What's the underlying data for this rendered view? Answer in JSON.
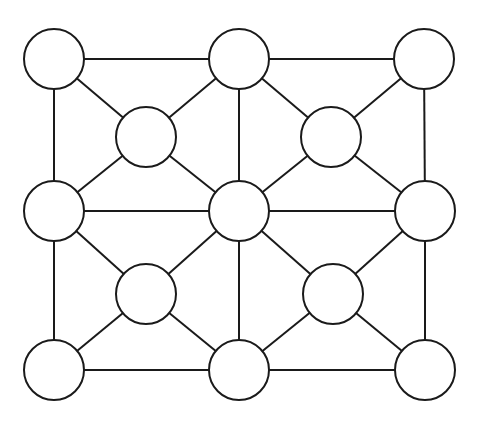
{
  "diagram": {
    "type": "graph",
    "node_radius": 30,
    "stroke_color": "#1a1a1a",
    "fill_color": "#ffffff",
    "nodes": [
      {
        "id": "n1",
        "x": 54,
        "y": 59
      },
      {
        "id": "n2",
        "x": 239,
        "y": 59
      },
      {
        "id": "n3",
        "x": 424,
        "y": 59
      },
      {
        "id": "n4",
        "x": 146,
        "y": 137
      },
      {
        "id": "n5",
        "x": 331,
        "y": 137
      },
      {
        "id": "n6",
        "x": 54,
        "y": 211
      },
      {
        "id": "n7",
        "x": 239,
        "y": 211
      },
      {
        "id": "n8",
        "x": 425,
        "y": 211
      },
      {
        "id": "n9",
        "x": 146,
        "y": 294
      },
      {
        "id": "n10",
        "x": 333,
        "y": 294
      },
      {
        "id": "n11",
        "x": 54,
        "y": 370
      },
      {
        "id": "n12",
        "x": 239,
        "y": 370
      },
      {
        "id": "n13",
        "x": 425,
        "y": 370
      }
    ],
    "edges": [
      [
        "n1",
        "n2"
      ],
      [
        "n2",
        "n3"
      ],
      [
        "n1",
        "n6"
      ],
      [
        "n6",
        "n11"
      ],
      [
        "n3",
        "n8"
      ],
      [
        "n8",
        "n13"
      ],
      [
        "n11",
        "n12"
      ],
      [
        "n12",
        "n13"
      ],
      [
        "n2",
        "n7"
      ],
      [
        "n7",
        "n12"
      ],
      [
        "n6",
        "n7"
      ],
      [
        "n7",
        "n8"
      ],
      [
        "n1",
        "n4"
      ],
      [
        "n4",
        "n7"
      ],
      [
        "n2",
        "n4"
      ],
      [
        "n4",
        "n6"
      ],
      [
        "n2",
        "n5"
      ],
      [
        "n5",
        "n8"
      ],
      [
        "n3",
        "n5"
      ],
      [
        "n5",
        "n7"
      ],
      [
        "n6",
        "n9"
      ],
      [
        "n9",
        "n12"
      ],
      [
        "n7",
        "n9"
      ],
      [
        "n9",
        "n11"
      ],
      [
        "n7",
        "n10"
      ],
      [
        "n10",
        "n13"
      ],
      [
        "n8",
        "n10"
      ],
      [
        "n10",
        "n12"
      ]
    ]
  }
}
